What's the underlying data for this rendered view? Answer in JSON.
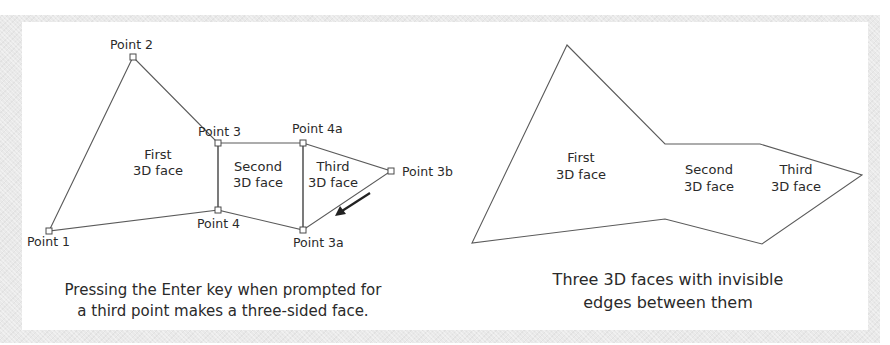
{
  "left_figure": {
    "points": {
      "p1": {
        "label": "Point 1"
      },
      "p2": {
        "label": "Point 2"
      },
      "p3": {
        "label": "Point 3"
      },
      "p4": {
        "label": "Point 4"
      },
      "p4a": {
        "label": "Point 4a"
      },
      "p3a": {
        "label": "Point 3a"
      },
      "p3b": {
        "label": "Point 3b"
      }
    },
    "faces": {
      "first": {
        "line1": "First",
        "line2": "3D face"
      },
      "second": {
        "line1": "Second",
        "line2": "3D face"
      },
      "third": {
        "line1": "Third",
        "line2": "3D face"
      }
    },
    "caption": {
      "line1": "Pressing the Enter key when prompted for",
      "line2": "a third point makes a three-sided face."
    }
  },
  "right_figure": {
    "faces": {
      "first": {
        "line1": "First",
        "line2": "3D face"
      },
      "second": {
        "line1": "Second",
        "line2": "3D face"
      },
      "third": {
        "line1": "Third",
        "line2": "3D face"
      }
    },
    "caption": {
      "line1": "Three 3D faces with invisible",
      "line2": "edges between them"
    }
  },
  "colors": {
    "line": "#5a5a5a",
    "text": "#2a2a2a",
    "frame": "#e9e9e9"
  }
}
